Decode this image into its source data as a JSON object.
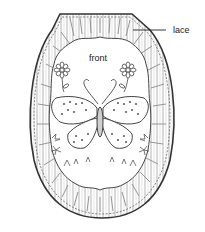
{
  "diagram": {
    "type": "illustration",
    "labels": {
      "lace": "lace",
      "front": "front"
    },
    "callouts": [
      {
        "label": "lace",
        "points_to": "lace ruffle border (upper right)"
      }
    ],
    "motifs": [
      "butterfly",
      "daisy-flower-left",
      "daisy-flower-right",
      "curled-antennae",
      "small-flowers-bottom"
    ],
    "colors": {
      "ink": "#333333",
      "shade": "#8a8a8a",
      "background": "#ffffff"
    }
  }
}
